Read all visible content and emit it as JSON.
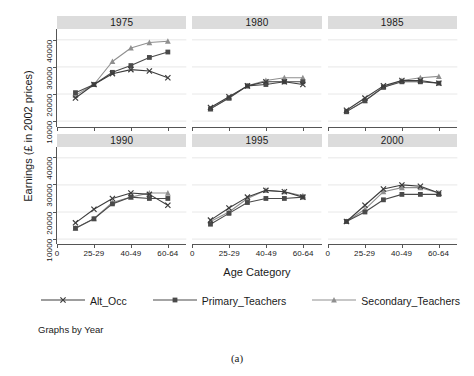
{
  "figure": {
    "caption": "(a)",
    "note": "Graphs by Year",
    "xlabel": "Age Category",
    "ylabel": "Earnings (£ in 2002 prices)"
  },
  "legend": {
    "items": [
      {
        "label": "Alt_Occ",
        "marker": "x-marker",
        "color": "#3c3c3c"
      },
      {
        "label": "Primary_Teachers",
        "marker": "square-marker",
        "color": "#4a4a4a"
      },
      {
        "label": "Secondary_Teachers",
        "marker": "triangle-marker",
        "color": "#8f8f8f"
      }
    ]
  },
  "chart_data": {
    "type": "line",
    "title": "",
    "xlabel": "Age Category",
    "ylabel": "Earnings (£ in 2002 prices)",
    "ylim": [
      8000,
      44000
    ],
    "yticks": [
      10000,
      20000,
      30000,
      40000
    ],
    "ytick_labels": [
      "10000",
      "20000",
      "30000",
      "40000"
    ],
    "xtick_labels": [
      "0",
      "25-29",
      "40-49",
      "60-64"
    ],
    "xtick_values": [
      0,
      2,
      4,
      6
    ],
    "x": [
      1,
      2,
      3,
      4,
      5,
      6
    ],
    "grid": "horizontal",
    "legend_position": "bottom",
    "facet_by": "Year",
    "panels": [
      {
        "title": "1975",
        "series": [
          {
            "name": "Alt_Occ",
            "values": [
              18500,
              23500,
              27500,
              29000,
              28500,
              26000
            ]
          },
          {
            "name": "Primary_Teachers",
            "values": [
              20500,
              23500,
              28000,
              30500,
              33500,
              35500
            ]
          },
          {
            "name": "Secondary_Teachers",
            "values": [
              19500,
              23500,
              32000,
              37000,
              39000,
              39500
            ]
          }
        ]
      },
      {
        "title": "1980",
        "series": [
          {
            "name": "Alt_Occ",
            "values": [
              15000,
              19000,
              23000,
              24500,
              24500,
              23500
            ]
          },
          {
            "name": "Primary_Teachers",
            "values": [
              14500,
              18500,
              23000,
              23500,
              24500,
              24500
            ]
          },
          {
            "name": "Secondary_Teachers",
            "values": [
              14500,
              18500,
              23000,
              25000,
              26000,
              26000
            ]
          }
        ]
      },
      {
        "title": "1985",
        "series": [
          {
            "name": "Alt_Occ",
            "values": [
              14000,
              18500,
              23000,
              25000,
              25000,
              24000
            ]
          },
          {
            "name": "Primary_Teachers",
            "values": [
              13500,
              17500,
              22500,
              24500,
              24500,
              24000
            ]
          },
          {
            "name": "Secondary_Teachers",
            "values": [
              13500,
              17500,
              22500,
              25000,
              26000,
              26500
            ]
          }
        ]
      },
      {
        "title": "1990",
        "series": [
          {
            "name": "Alt_Occ",
            "values": [
              16000,
              21000,
              25000,
              27000,
              26500,
              22500
            ]
          },
          {
            "name": "Primary_Teachers",
            "values": [
              14000,
              17500,
              23000,
              25500,
              25000,
              25000
            ]
          },
          {
            "name": "Secondary_Teachers",
            "values": [
              14000,
              17500,
              23500,
              25500,
              27000,
              27000
            ]
          }
        ]
      },
      {
        "title": "1995",
        "series": [
          {
            "name": "Alt_Occ",
            "values": [
              17000,
              21500,
              25500,
              28000,
              27500,
              25500
            ]
          },
          {
            "name": "Primary_Teachers",
            "values": [
              15500,
              19500,
              23500,
              25000,
              25000,
              25500
            ]
          },
          {
            "name": "Secondary_Teachers",
            "values": [
              16500,
              20000,
              25000,
              28000,
              27500,
              26000
            ]
          }
        ]
      },
      {
        "title": "2000",
        "series": [
          {
            "name": "Alt_Occ",
            "values": [
              16500,
              22500,
              28500,
              30000,
              29500,
              27000
            ]
          },
          {
            "name": "Primary_Teachers",
            "values": [
              16500,
              20000,
              24500,
              26500,
              26500,
              26500
            ]
          },
          {
            "name": "Secondary_Teachers",
            "values": [
              16500,
              21000,
              27500,
              29000,
              29000,
              27000
            ]
          }
        ]
      }
    ]
  }
}
